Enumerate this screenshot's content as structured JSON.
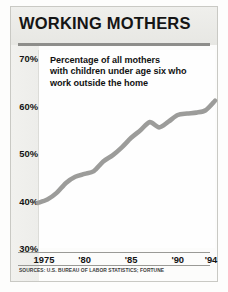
{
  "figure": {
    "title": "WORKING MOTHERS",
    "source_note": "SOURCES: U.S. BUREAU OF LABOR STATISTICS; FORTUNE"
  },
  "subtitle_lines": [
    "Percentage of all mothers",
    "with children under age six who",
    "work outside the home"
  ],
  "colors": {
    "line": "#9c9c9a",
    "title_band": "#ebebe8",
    "rule": "#8d8d8a",
    "text": "#141414",
    "plot_background": "#fefefe"
  },
  "chart_data": {
    "type": "line",
    "title": "WORKING MOTHERS",
    "subtitle": "Percentage of all mothers with children under age six who work outside the home",
    "xlabel": "",
    "ylabel": "",
    "grid": false,
    "legend": "none",
    "xlim": [
      1975,
      1994
    ],
    "ylim": [
      30,
      70
    ],
    "ytick_labels": [
      "70%",
      "60%",
      "50%",
      "40%",
      "30%"
    ],
    "ytick_values": [
      70,
      60,
      50,
      40,
      30
    ],
    "xtick_labels": [
      "1975",
      "'80",
      "'85",
      "'90",
      "'94"
    ],
    "xtick_values": [
      1975,
      1980,
      1985,
      1990,
      1994
    ],
    "y_unit": "percent",
    "series": [
      {
        "name": "Mothers with children under age six working outside the home",
        "x": [
          1975,
          1976,
          1977,
          1978,
          1979,
          1980,
          1981,
          1982,
          1983,
          1984,
          1985,
          1986,
          1987,
          1988,
          1989,
          1990,
          1991,
          1992,
          1993,
          1994
        ],
        "values": [
          39.5,
          40.2,
          41.6,
          43.7,
          45.0,
          45.6,
          46.2,
          48.2,
          49.5,
          51.2,
          53.2,
          54.8,
          56.5,
          55.4,
          56.6,
          58.0,
          58.3,
          58.5,
          59.0,
          61.0
        ]
      }
    ],
    "annotations": [
      "SOURCES: U.S. BUREAU OF LABOR STATISTICS; FORTUNE"
    ]
  }
}
